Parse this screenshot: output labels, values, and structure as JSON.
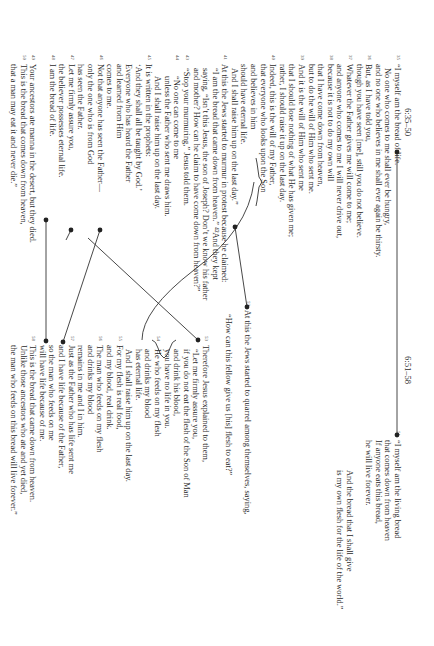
{
  "left": {
    "header": "6:35–50",
    "lines": [
      {
        "v": "35",
        "t": "“I myself am the bread of life.",
        "i": 0
      },
      {
        "v": "",
        "t": "No one who comes to me shall ever be hungry,",
        "i": 1
      },
      {
        "v": "",
        "t": "and no one who believes in me shall ever again be thirsty.",
        "i": 0
      },
      {
        "v": "36",
        "t": "But, as I have told you,",
        "i": 0
      },
      {
        "v": "",
        "t": "though you have seen [me], still you do not believe.",
        "i": 0
      },
      {
        "v": "37",
        "t": "Whatever the Father gives me will come to me;",
        "i": 0
      },
      {
        "v": "",
        "t": "and anyone who comes to me I will never drive out,",
        "i": 0
      },
      {
        "v": "38",
        "t": "because it is not to do my own will",
        "i": 0
      },
      {
        "v": "",
        "t": "that I have come down from heaven,",
        "i": 0
      },
      {
        "v": "",
        "t": "but to do the will of Him who sent me.",
        "i": 0
      },
      {
        "v": "39",
        "t": "And it is the will of Him who sent me",
        "i": 0
      },
      {
        "v": "",
        "t": "that I should lose nothing of what He has given me;",
        "i": 0
      },
      {
        "v": "",
        "t": "rather, I should raise it up on the last day.",
        "i": 0
      },
      {
        "v": "40",
        "t": "Indeed, this is the will of my Father,",
        "i": 0
      },
      {
        "v": "",
        "t": "that everyone who looks upon the Son",
        "i": 0
      },
      {
        "v": "",
        "t": "and believes in him",
        "i": 0
      },
      {
        "v": "",
        "t": "should have eternal life.",
        "i": 0
      },
      {
        "v": "",
        "t": "And I shall raise him up on the last day.”",
        "i": 1
      },
      {
        "v": "41",
        "t": "At this the Jews started to murmur in protest because he claimed:",
        "i": 0
      },
      {
        "v": "",
        "t": "“I am the bread that came down from heaven.” ⁴²And they kept",
        "i": 1
      },
      {
        "v": "",
        "t": "saying, “Isn’t this Jesus, the son of Joseph? Don’t we know his father",
        "i": 1
      },
      {
        "v": "",
        "t": "and mother? How can he claim to have come down from heaven?”",
        "i": 1
      },
      {
        "v": "43",
        "t": "“Stop your murmuring,” Jesus told them.",
        "i": 1
      },
      {
        "v": "44",
        "t": "“No one can come to me",
        "i": 2
      },
      {
        "v": "",
        "t": "unless the Father who sent me draws him.",
        "i": 2
      },
      {
        "v": "",
        "t": "And I shall raise him up on the last day.",
        "i": 2
      },
      {
        "v": "45",
        "t": "It is written in the prophets:",
        "i": 0
      },
      {
        "v": "",
        "t": "‘And they shall all be taught by God.’",
        "i": 0
      },
      {
        "v": "",
        "t": "Everyone who has heard the Father",
        "i": 0
      },
      {
        "v": "",
        "t": "and learned from Him",
        "i": 0
      },
      {
        "v": "",
        "t": "comes to me.",
        "i": 0
      },
      {
        "v": "46",
        "t": "Not that anyone has seen the Father—",
        "i": 0
      },
      {
        "v": "",
        "t": "only the one who is from God",
        "i": 0
      },
      {
        "v": "",
        "t": "has seen the Father.",
        "i": 0
      },
      {
        "v": "47",
        "t": "Let me firmly assure you,",
        "i": 0
      },
      {
        "v": "",
        "t": "the believer possesses eternal life.",
        "i": 0
      },
      {
        "v": "48",
        "t": "I am the bread of life.",
        "i": 0
      },
      {
        "v": "",
        "t": "",
        "i": 0
      },
      {
        "v": "49",
        "t": "Your ancestors ate manna in the desert, but they died.",
        "i": 0
      },
      {
        "v": "50",
        "t": "This is the bread that comes down from heaven,",
        "i": 0
      },
      {
        "v": "",
        "t": "that a man may eat it and never die.”",
        "i": 0
      }
    ]
  },
  "right": {
    "header": "6:51–58",
    "top_lines": [
      {
        "v": "51",
        "t": "“I myself am the living bread",
        "i": 0
      },
      {
        "v": "",
        "t": "that comes down from heaven",
        "i": 0
      },
      {
        "v": "",
        "t": "If anyone eats this bread,",
        "i": 0
      },
      {
        "v": "",
        "t": "he will live forever.",
        "i": 0
      }
    ],
    "mid_lines": [
      {
        "v": "",
        "t": "And the bread that I shall give",
        "i": 0
      },
      {
        "v": "",
        "t": "is my own flesh for the life of the world.”",
        "i": 0
      }
    ],
    "v52_lines": [
      {
        "v": "52",
        "t": "At this the Jews started to quarrel among themselves, saying,",
        "i": 0
      },
      {
        "v": "",
        "t": "",
        "i": 0
      },
      {
        "v": "",
        "t": "“How can this fellow give us [his] flesh to eat?”",
        "i": 1
      }
    ],
    "lower_lines": [
      {
        "v": "53",
        "t": "Therefore Jesus explained to them,",
        "i": 0
      },
      {
        "v": "",
        "t": "“Let me firmly assure you,",
        "i": 1
      },
      {
        "v": "",
        "t": "if you do not eat the flesh of the Son of Man",
        "i": 1
      },
      {
        "v": "",
        "t": "and drink his blood,",
        "i": 1
      },
      {
        "v": "",
        "t": "you have no life in you.",
        "i": 1
      },
      {
        "v": "54",
        "t": "He who feeds on my flesh",
        "i": 1
      },
      {
        "v": "",
        "t": "and drinks my blood",
        "i": 1
      },
      {
        "v": "",
        "t": "has eternal life.",
        "i": 1
      },
      {
        "v": "",
        "t": "And I shall raise him up on the last day.",
        "i": 1
      },
      {
        "v": "55",
        "t": "For my flesh is real food,",
        "i": 0
      },
      {
        "v": "",
        "t": "and my blood, real drink.",
        "i": 0
      },
      {
        "v": "56",
        "t": "The man who feeds on my flesh",
        "i": 0
      },
      {
        "v": "",
        "t": "and drinks my blood",
        "i": 0
      },
      {
        "v": "",
        "t": "remains in me and I in him.",
        "i": 0
      },
      {
        "v": "57",
        "t": "Just as the Father who has life sent me",
        "i": 0
      },
      {
        "v": "",
        "t": "and I have life because of the Father,",
        "i": 0
      },
      {
        "v": "",
        "t": "so the man who feeds on me",
        "i": 0
      },
      {
        "v": "",
        "t": "will have life because of me.",
        "i": 0
      },
      {
        "v": "58",
        "t": "This is the bread that came down from heaven.",
        "i": 0
      },
      {
        "v": "",
        "t": "Unlike those ancestors who ate and yet died,",
        "i": 0
      },
      {
        "v": "",
        "t": "the man who feeds on this bread will live forever.”",
        "i": 0
      }
    ]
  },
  "colors": {
    "text": "#2a2a2a",
    "line": "#333333",
    "background": "#ffffff"
  }
}
